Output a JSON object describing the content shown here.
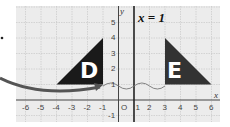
{
  "diagram": {
    "type": "coordinate-grid-reflection",
    "line_label": "x = 1",
    "axis_labels": {
      "x": "x",
      "y": "y",
      "origin": "O"
    },
    "x_ticks": [
      "-6",
      "-5",
      "-4",
      "-3",
      "-2",
      "-1",
      "1",
      "2",
      "3",
      "4",
      "5",
      "6"
    ],
    "y_ticks": [
      "5",
      "4",
      "3",
      "2",
      "1",
      "-1"
    ],
    "shapes": [
      {
        "label": "D",
        "vertices": [
          [
            -4,
            1
          ],
          [
            -1,
            1
          ],
          [
            -1,
            4
          ]
        ],
        "color": "#1a1a1a"
      },
      {
        "label": "E",
        "vertices": [
          [
            3,
            1
          ],
          [
            6,
            1
          ],
          [
            3,
            4
          ]
        ],
        "color": "#333333"
      }
    ],
    "colors": {
      "grid_bg": "#ececec",
      "grid_line": "#c8c8c8",
      "axis": "#333333",
      "arrow": "#4a4a4a"
    }
  }
}
